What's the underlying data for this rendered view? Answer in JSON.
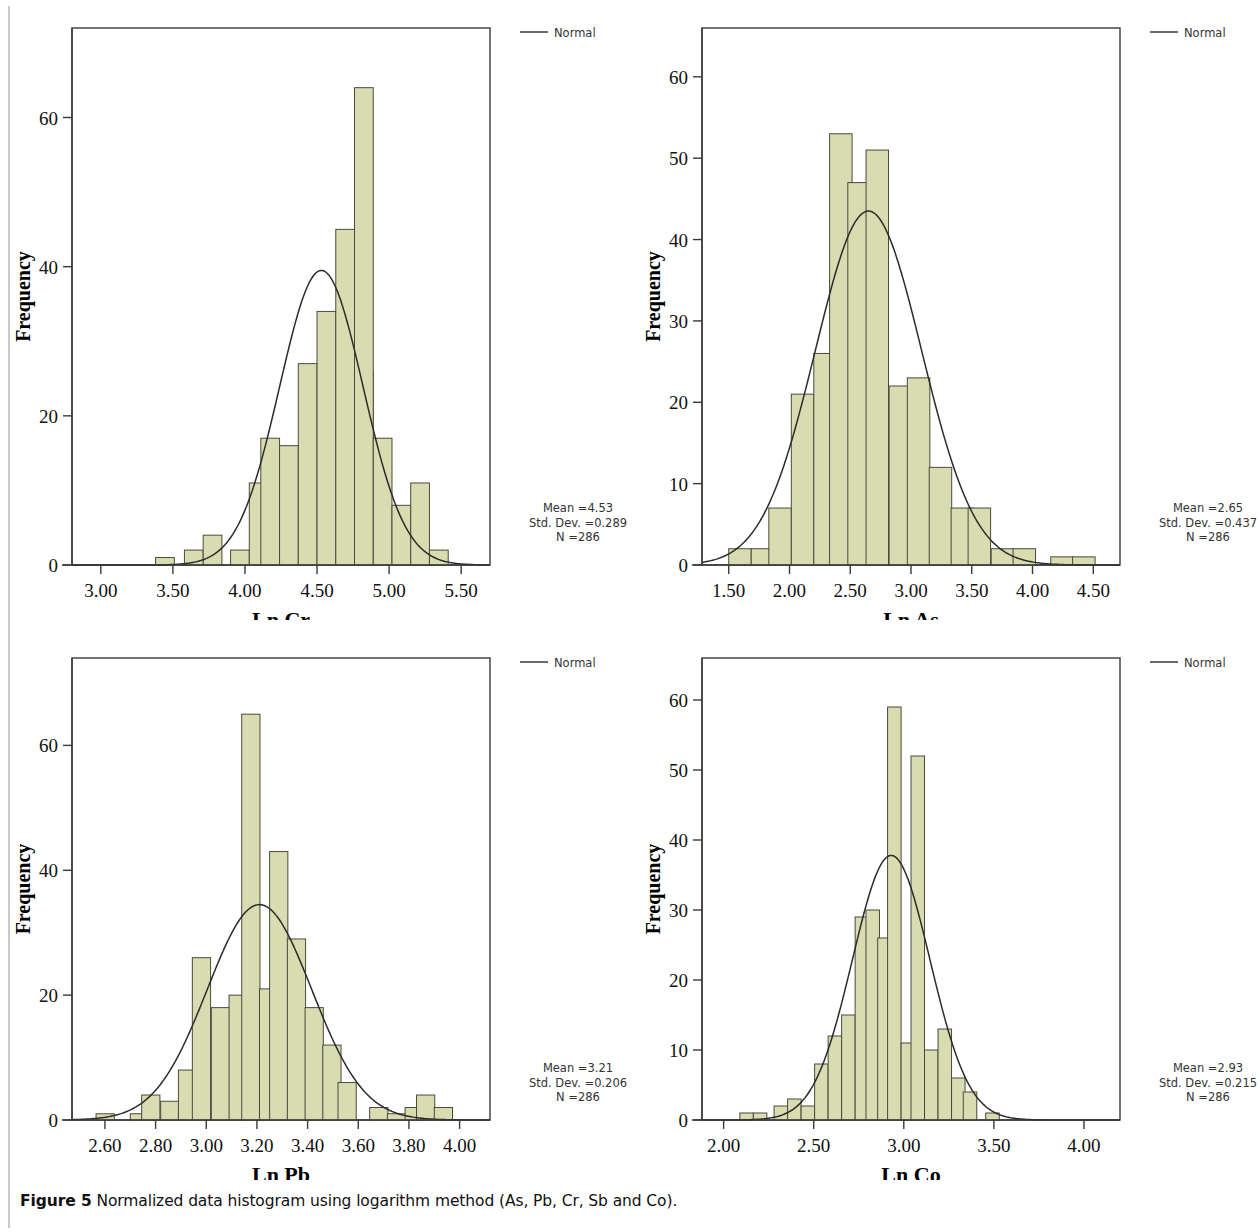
{
  "caption": {
    "prefix": "Figure 5",
    "text": " Normalized data histogram using logarithm method (As, Pb, Cr, Sb and Co)."
  },
  "legend": {
    "label": "Normal"
  },
  "axis": {
    "y_title": "Frequency"
  },
  "colors": {
    "bar_fill": "#d9dcb0",
    "bar_stroke": "#4a4a3c",
    "curve": "#2b2b2b",
    "frame": "#3a3a3a",
    "text": "#111111"
  },
  "stats_labels": {
    "mean_prefix": "Mean =",
    "sd_prefix": "Std. Dev. =",
    "n_prefix": "N ="
  },
  "chart_data": [
    {
      "id": "ln-cr",
      "type": "bar",
      "title": "",
      "xlabel": "Ln Cr",
      "ylabel": "Frequency",
      "xlim": [
        2.8,
        5.7
      ],
      "ylim": [
        0,
        72
      ],
      "xticks": [
        "3.00",
        "3.50",
        "4.00",
        "4.50",
        "5.00",
        "5.50"
      ],
      "xtick_values": [
        3.0,
        3.5,
        4.0,
        4.5,
        5.0,
        5.5
      ],
      "yticks": [
        "0",
        "20",
        "40",
        "60"
      ],
      "ytick_values": [
        0,
        20,
        40,
        60
      ],
      "bin_width": 0.13,
      "bin_starts": [
        3.38,
        3.58,
        3.71,
        3.9,
        4.03,
        4.16,
        4.29,
        4.42,
        4.55,
        4.68,
        4.81,
        4.94,
        5.07
      ],
      "values": [
        1,
        2,
        4,
        2,
        11,
        17,
        16,
        27,
        34,
        45,
        26,
        17,
        8,
        11,
        2
      ],
      "bars": [
        {
          "x": 3.38,
          "w": 0.13,
          "h": 1
        },
        {
          "x": 3.58,
          "w": 0.13,
          "h": 2
        },
        {
          "x": 3.71,
          "w": 0.13,
          "h": 4
        },
        {
          "x": 3.9,
          "w": 0.13,
          "h": 2
        },
        {
          "x": 4.03,
          "w": 0.13,
          "h": 11
        },
        {
          "x": 4.11,
          "w": 0.13,
          "h": 17
        },
        {
          "x": 4.24,
          "w": 0.13,
          "h": 16
        },
        {
          "x": 4.37,
          "w": 0.13,
          "h": 27
        },
        {
          "x": 4.5,
          "w": 0.13,
          "h": 34
        },
        {
          "x": 4.63,
          "w": 0.13,
          "h": 45
        },
        {
          "x": 4.76,
          "w": 0.13,
          "h": 26
        },
        {
          "x": 4.76,
          "w": 0.13,
          "h": 64
        },
        {
          "x": 4.89,
          "w": 0.13,
          "h": 17
        },
        {
          "x": 5.02,
          "w": 0.13,
          "h": 8
        },
        {
          "x": 5.15,
          "w": 0.13,
          "h": 11
        },
        {
          "x": 5.28,
          "w": 0.13,
          "h": 2
        }
      ],
      "normal": {
        "mean": 4.53,
        "sd": 0.289,
        "n": 286,
        "peak": 39.5
      },
      "stats": {
        "mean": "4.53",
        "sd": "0.289",
        "n": "286"
      },
      "legend_label": "Normal"
    },
    {
      "id": "ln-as",
      "type": "bar",
      "title": "",
      "xlabel": "Ln As",
      "ylabel": "Frequency",
      "xlim": [
        1.28,
        4.72
      ],
      "ylim": [
        0,
        66
      ],
      "xticks": [
        "1.50",
        "2.00",
        "2.50",
        "3.00",
        "3.50",
        "4.00",
        "4.50"
      ],
      "xtick_values": [
        1.5,
        2.0,
        2.5,
        3.0,
        3.5,
        4.0,
        4.5
      ],
      "yticks": [
        "0",
        "10",
        "20",
        "30",
        "40",
        "50",
        "60"
      ],
      "ytick_values": [
        0,
        10,
        20,
        30,
        40,
        50,
        60
      ],
      "bin_width": 0.185,
      "bars": [
        {
          "x": 1.5,
          "w": 0.185,
          "h": 2
        },
        {
          "x": 1.685,
          "w": 0.185,
          "h": 2
        },
        {
          "x": 1.83,
          "w": 0.185,
          "h": 7
        },
        {
          "x": 2.015,
          "w": 0.185,
          "h": 21
        },
        {
          "x": 2.2,
          "w": 0.185,
          "h": 26
        },
        {
          "x": 2.33,
          "w": 0.185,
          "h": 53
        },
        {
          "x": 2.48,
          "w": 0.185,
          "h": 47
        },
        {
          "x": 2.63,
          "w": 0.185,
          "h": 51
        },
        {
          "x": 2.82,
          "w": 0.185,
          "h": 22
        },
        {
          "x": 2.97,
          "w": 0.185,
          "h": 23
        },
        {
          "x": 3.15,
          "w": 0.185,
          "h": 12
        },
        {
          "x": 3.33,
          "w": 0.185,
          "h": 7
        },
        {
          "x": 3.47,
          "w": 0.185,
          "h": 7
        },
        {
          "x": 3.66,
          "w": 0.185,
          "h": 2
        },
        {
          "x": 3.84,
          "w": 0.185,
          "h": 2
        },
        {
          "x": 4.15,
          "w": 0.185,
          "h": 1
        },
        {
          "x": 4.33,
          "w": 0.185,
          "h": 1
        }
      ],
      "normal": {
        "mean": 2.65,
        "sd": 0.437,
        "n": 286,
        "peak": 43.5
      },
      "stats": {
        "mean": "2.65",
        "sd": "0.437",
        "n": "286"
      },
      "legend_label": "Normal"
    },
    {
      "id": "ln-pb",
      "type": "bar",
      "title": "",
      "xlabel": "Ln Pb",
      "ylabel": "Frequency",
      "xlim": [
        2.47,
        4.12
      ],
      "ylim": [
        0,
        74
      ],
      "xticks": [
        "2.60",
        "2.80",
        "3.00",
        "3.20",
        "3.40",
        "3.60",
        "3.80",
        "4.00"
      ],
      "xtick_values": [
        2.6,
        2.8,
        3.0,
        3.2,
        3.4,
        3.6,
        3.8,
        4.0
      ],
      "yticks": [
        "0",
        "20",
        "40",
        "60"
      ],
      "ytick_values": [
        0,
        20,
        40,
        60
      ],
      "bin_width": 0.075,
      "bars": [
        {
          "x": 2.565,
          "w": 0.072,
          "h": 1
        },
        {
          "x": 2.7,
          "w": 0.072,
          "h": 1
        },
        {
          "x": 2.745,
          "w": 0.072,
          "h": 4
        },
        {
          "x": 2.82,
          "w": 0.072,
          "h": 3
        },
        {
          "x": 2.89,
          "w": 0.072,
          "h": 8
        },
        {
          "x": 2.945,
          "w": 0.072,
          "h": 26
        },
        {
          "x": 3.02,
          "w": 0.072,
          "h": 18
        },
        {
          "x": 3.09,
          "w": 0.072,
          "h": 20
        },
        {
          "x": 3.14,
          "w": 0.072,
          "h": 65
        },
        {
          "x": 3.21,
          "w": 0.072,
          "h": 21
        },
        {
          "x": 3.25,
          "w": 0.072,
          "h": 43
        },
        {
          "x": 3.32,
          "w": 0.072,
          "h": 29
        },
        {
          "x": 3.39,
          "w": 0.072,
          "h": 18
        },
        {
          "x": 3.46,
          "w": 0.072,
          "h": 12
        },
        {
          "x": 3.52,
          "w": 0.072,
          "h": 6
        },
        {
          "x": 3.645,
          "w": 0.072,
          "h": 2
        },
        {
          "x": 3.715,
          "w": 0.072,
          "h": 1
        },
        {
          "x": 3.785,
          "w": 0.072,
          "h": 2
        },
        {
          "x": 3.83,
          "w": 0.072,
          "h": 4
        },
        {
          "x": 3.9,
          "w": 0.072,
          "h": 2
        }
      ],
      "normal": {
        "mean": 3.21,
        "sd": 0.206,
        "n": 286,
        "peak": 34.5
      },
      "stats": {
        "mean": "3.21",
        "sd": "0.206",
        "n": "286"
      },
      "legend_label": "Normal"
    },
    {
      "id": "ln-co",
      "type": "bar",
      "title": "",
      "xlabel": "Ln Co",
      "ylabel": "Frequency",
      "xlim": [
        1.88,
        4.2
      ],
      "ylim": [
        0,
        66
      ],
      "xticks": [
        "2.00",
        "2.50",
        "3.00",
        "3.50",
        "4.00"
      ],
      "xtick_values": [
        2.0,
        2.5,
        3.0,
        3.5,
        4.0
      ],
      "yticks": [
        "0",
        "10",
        "20",
        "30",
        "40",
        "50",
        "60"
      ],
      "ytick_values": [
        0,
        10,
        20,
        30,
        40,
        50,
        60
      ],
      "bin_width": 0.077,
      "bars": [
        {
          "x": 2.09,
          "w": 0.075,
          "h": 1
        },
        {
          "x": 2.165,
          "w": 0.075,
          "h": 1
        },
        {
          "x": 2.28,
          "w": 0.075,
          "h": 2
        },
        {
          "x": 2.355,
          "w": 0.075,
          "h": 3
        },
        {
          "x": 2.43,
          "w": 0.075,
          "h": 2
        },
        {
          "x": 2.505,
          "w": 0.075,
          "h": 8
        },
        {
          "x": 2.58,
          "w": 0.075,
          "h": 12
        },
        {
          "x": 2.655,
          "w": 0.075,
          "h": 15
        },
        {
          "x": 2.73,
          "w": 0.075,
          "h": 29
        },
        {
          "x": 2.79,
          "w": 0.075,
          "h": 30
        },
        {
          "x": 2.855,
          "w": 0.075,
          "h": 26
        },
        {
          "x": 2.91,
          "w": 0.075,
          "h": 59
        },
        {
          "x": 2.985,
          "w": 0.075,
          "h": 11
        },
        {
          "x": 3.04,
          "w": 0.075,
          "h": 52
        },
        {
          "x": 3.115,
          "w": 0.075,
          "h": 10
        },
        {
          "x": 3.19,
          "w": 0.075,
          "h": 13
        },
        {
          "x": 3.265,
          "w": 0.075,
          "h": 6
        },
        {
          "x": 3.33,
          "w": 0.075,
          "h": 4
        },
        {
          "x": 3.455,
          "w": 0.075,
          "h": 1
        }
      ],
      "normal": {
        "mean": 2.93,
        "sd": 0.215,
        "n": 286,
        "peak": 37.8
      },
      "stats": {
        "mean": "2.93",
        "sd": "0.215",
        "n": "286"
      },
      "legend_label": "Normal"
    }
  ]
}
